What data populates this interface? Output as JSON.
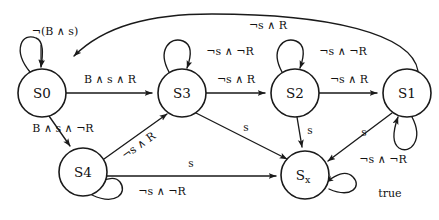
{
  "diagram": {
    "type": "finite-state-machine",
    "states": [
      {
        "id": "S0",
        "label": "S0",
        "sub": "",
        "cx": 42,
        "cy": 93,
        "r": 24
      },
      {
        "id": "S3",
        "label": "S3",
        "sub": "",
        "cx": 182,
        "cy": 93,
        "r": 24
      },
      {
        "id": "S2",
        "label": "S2",
        "sub": "",
        "cx": 295,
        "cy": 93,
        "r": 24
      },
      {
        "id": "S1",
        "label": "S1",
        "sub": "",
        "cx": 407,
        "cy": 93,
        "r": 24
      },
      {
        "id": "S4",
        "label": "S4",
        "sub": "",
        "cx": 83,
        "cy": 172,
        "r": 24
      },
      {
        "id": "Sx",
        "label": "S",
        "sub": "x",
        "cx": 305,
        "cy": 175,
        "r": 24
      }
    ],
    "transitions": [
      {
        "from": "S0",
        "to": "S0",
        "label": "¬(B ∧ s)",
        "kind": "self-loop-top"
      },
      {
        "from": "S1",
        "to": "S0",
        "label": "¬s ∧ R",
        "kind": "arc-top"
      },
      {
        "from": "S0",
        "to": "S3",
        "label": "B ∧ s ∧ R",
        "kind": "straight"
      },
      {
        "from": "S3",
        "to": "S3",
        "label": "¬s ∧ ¬R",
        "kind": "self-loop-top"
      },
      {
        "from": "S3",
        "to": "S2",
        "label": "¬s ∧ R",
        "kind": "straight"
      },
      {
        "from": "S2",
        "to": "S2",
        "label": "¬s ∧ ¬R",
        "kind": "self-loop-top"
      },
      {
        "from": "S2",
        "to": "S1",
        "label": "¬s ∧ R",
        "kind": "straight"
      },
      {
        "from": "S1",
        "to": "S1",
        "label": "¬s ∧ ¬R",
        "kind": "self-loop-bottom"
      },
      {
        "from": "S0",
        "to": "S4",
        "label": "B ∧ s ∧ ¬R",
        "kind": "diagonal"
      },
      {
        "from": "S4",
        "to": "S3",
        "label": "¬s ∧ R",
        "kind": "diagonal-rotated"
      },
      {
        "from": "S4",
        "to": "S4",
        "label": "¬s ∧ ¬R",
        "kind": "self-loop-bottom"
      },
      {
        "from": "S4",
        "to": "Sx",
        "label": "s",
        "kind": "straight"
      },
      {
        "from": "S3",
        "to": "Sx",
        "label": "s",
        "kind": "diagonal"
      },
      {
        "from": "S2",
        "to": "Sx",
        "label": "s",
        "kind": "straight-vertical"
      },
      {
        "from": "S1",
        "to": "Sx",
        "label": "s",
        "kind": "diagonal"
      },
      {
        "from": "Sx",
        "to": "Sx",
        "label": "true",
        "kind": "self-loop-right"
      }
    ],
    "colors": {
      "ink": "#1a1a1a",
      "background": "#ffffff"
    }
  }
}
